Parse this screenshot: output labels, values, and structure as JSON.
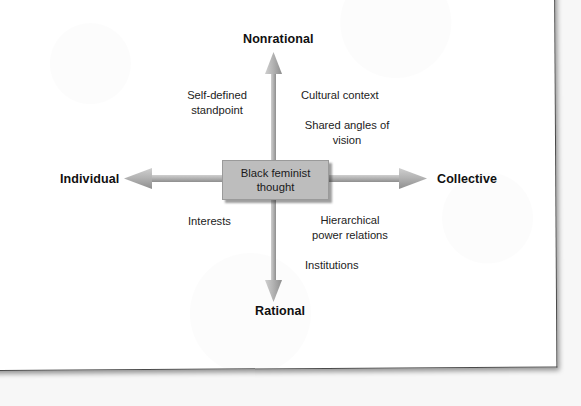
{
  "figure": {
    "type": "conceptual-axes-diagram",
    "center": {
      "label": "Black feminist\nthought",
      "fill_color": "#bdbdbd"
    },
    "axes": {
      "vertical": {
        "top_label": "Nonrational",
        "bottom_label": "Rational"
      },
      "horizontal": {
        "left_label": "Individual",
        "right_label": "Collective"
      },
      "arrow_color": "#a8a8a8"
    },
    "quadrants": {
      "top_left": [
        "Self-defined\nstandpoint"
      ],
      "top_right": [
        "Cultural context",
        "Shared angles of\nvision"
      ],
      "bottom_left": [
        "Interests"
      ],
      "bottom_right": [
        "Hierarchical\npower relations",
        "Institutions"
      ]
    }
  },
  "quadrant_text": {
    "self_defined": "Self-defined\nstandpoint",
    "cultural_context": "Cultural context",
    "shared_angles": "Shared angles of\nvision",
    "interests": "Interests",
    "hierarchical": "Hierarchical\npower relations",
    "institutions": "Institutions"
  }
}
